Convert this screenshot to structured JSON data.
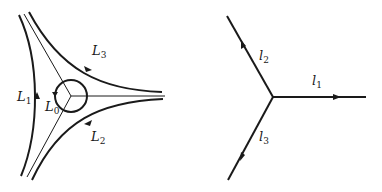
{
  "left_diagram": {
    "labels": [
      {
        "id": "L1",
        "base": "L",
        "sub": "1"
      },
      {
        "id": "L0",
        "base": "L",
        "sub": "0"
      },
      {
        "id": "L2",
        "base": "L",
        "sub": "2"
      },
      {
        "id": "L3",
        "base": "L",
        "sub": "3"
      }
    ],
    "description": "Three curved contours L1, L2, L3 around a three-pronged junction enclosed by small circular contour L0"
  },
  "right_diagram": {
    "labels": [
      {
        "id": "l1",
        "base": "l",
        "sub": "1"
      },
      {
        "id": "l2",
        "base": "l",
        "sub": "2"
      },
      {
        "id": "l3",
        "base": "l",
        "sub": "3"
      }
    ],
    "description": "Three rays l1, l2, l3 emanating from a common vertex"
  },
  "colors": {
    "stroke": "#1a1a1a",
    "background": "#ffffff"
  }
}
